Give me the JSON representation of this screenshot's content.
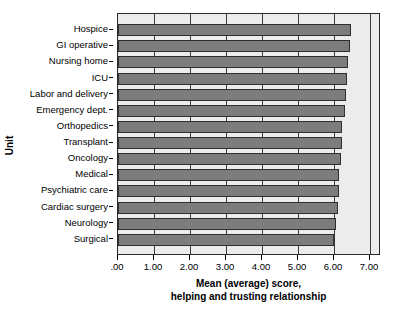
{
  "chart_data": {
    "type": "bar",
    "orientation": "horizontal",
    "title": "",
    "xlabel": "Mean (average) score, helping and trusting relationship",
    "xlabel_lines": [
      "Mean (average) score,",
      "helping and trusting relationship"
    ],
    "ylabel": "Unit",
    "categories": [
      "Hospice",
      "GI operative",
      "Nursing home",
      "ICU",
      "Labor and delivery",
      "Emergency dept.",
      "Orthopedics",
      "Transplant",
      "Oncology",
      "Medical",
      "Psychiatric care",
      "Cardiac surgery",
      "Neurology",
      "Surgical"
    ],
    "values": [
      6.46,
      6.44,
      6.39,
      6.36,
      6.33,
      6.31,
      6.23,
      6.21,
      6.2,
      6.14,
      6.13,
      6.1,
      6.04,
      6.0
    ],
    "xlim": [
      0,
      7.3
    ],
    "xticks": [
      0,
      1,
      2,
      3,
      4,
      5,
      6,
      7
    ],
    "xticklabels": [
      ".00",
      "1.00",
      "2.00",
      "3.00",
      "4.00",
      "5.00",
      "6.00",
      "7.00"
    ],
    "grid": "vertical",
    "legend": "none",
    "colors": {
      "bar_fill": "#7c7c7c",
      "bar_edge": "#2f2f2f",
      "plot_background": "#ececec",
      "gridline": "#3a3a3a",
      "axis": "#2b2b2b",
      "text": "#000000"
    }
  }
}
